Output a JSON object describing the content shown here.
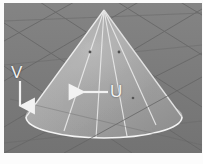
{
  "viewport": {
    "width": 203,
    "height": 164,
    "background_color": "#ffffff",
    "scene_background_color": "#7b7b7b",
    "title": "3D cone surface with UV parameter direction annotations"
  },
  "scene": {
    "object_name": "cone",
    "shading": "flat-grey-shaded",
    "surface_color": "#9a9a9a",
    "surface_highlight_color": "#b4b4b4",
    "wireframe_color": "#e8e8e8",
    "ground_grid_color": "#6a6a6a",
    "ground_color": "#7b7b7b",
    "apex": {
      "x": 104,
      "y": 10
    },
    "base_center": {
      "x": 104,
      "y": 117
    },
    "base_radius_x": 78,
    "base_radius_y": 21,
    "meridian_count": 4,
    "vertex_dot_color": "#4a4a4a",
    "vertex_dots": [
      {
        "x": 90,
        "y": 52
      },
      {
        "x": 119,
        "y": 52
      },
      {
        "x": 133,
        "y": 98
      }
    ]
  },
  "annotations": [
    {
      "id": "v-direction",
      "label": "V",
      "arrow_direction": "down",
      "color": "#f2f2f2",
      "label_position": {
        "x": 11,
        "y": 64
      },
      "arrow": {
        "x1": 20,
        "y1": 82,
        "x2": 20,
        "y2": 110
      }
    },
    {
      "id": "u-direction",
      "label": "U",
      "arrow_direction": "left",
      "color": "#f2f2f2",
      "label_position": {
        "x": 110,
        "y": 83
      },
      "arrow": {
        "x1": 108,
        "y1": 92,
        "x2": 81,
        "y2": 92
      }
    }
  ],
  "labels": {
    "v": "V",
    "u": "U"
  }
}
